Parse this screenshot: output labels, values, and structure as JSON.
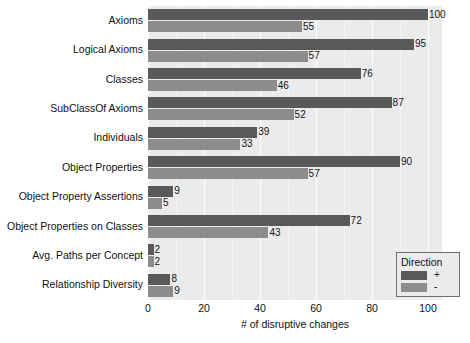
{
  "chart_data": {
    "type": "bar",
    "orientation": "horizontal",
    "title": "",
    "xlabel": "# of disruptive changes",
    "ylabel": "",
    "xlim": [
      0,
      105
    ],
    "xticks": [
      0,
      20,
      40,
      60,
      80,
      100
    ],
    "xtick_labels": [
      "0",
      "20",
      "40",
      "60",
      "80",
      "100"
    ],
    "grid": true,
    "grid_axis": "x",
    "legend": {
      "title": "Direction",
      "position": "bottom-right",
      "entries": [
        {
          "label": "+",
          "color": "#595959"
        },
        {
          "label": "-",
          "color": "#8c8c8c"
        }
      ]
    },
    "categories": [
      "Axioms",
      "Logical Axioms",
      "Classes",
      "SubClassOf Axioms",
      "Individuals",
      "Object Properties",
      "Object Property Assertions",
      "Object Properties on Classes",
      "Avg. Paths per Concept",
      "Relationship Diversity"
    ],
    "series": [
      {
        "name": "+",
        "color": "#595959",
        "values": [
          100,
          95,
          76,
          87,
          39,
          90,
          9,
          72,
          2,
          8
        ]
      },
      {
        "name": "-",
        "color": "#8c8c8c",
        "values": [
          55,
          57,
          46,
          52,
          33,
          57,
          5,
          43,
          2,
          9
        ]
      }
    ],
    "colors": {
      "plot_background": "#ebebeb",
      "gridline": "#ffffff",
      "bar_plus": "#595959",
      "bar_minus": "#8c8c8c",
      "text": "#111111",
      "legend_border": "#6f6f6f"
    }
  }
}
